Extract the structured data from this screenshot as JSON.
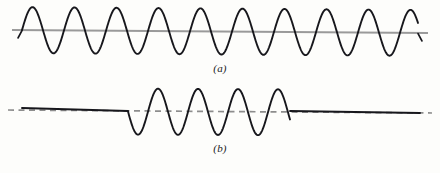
{
  "figure": {
    "title": "",
    "background_color": "#fdfdfb",
    "width": 440,
    "height": 173
  },
  "panels": [
    {
      "id": "a",
      "label": "(a)",
      "description": "continuous sinusoidal wave train",
      "axis": {
        "style": "solid",
        "color": "#9a9a9a",
        "x_start": 12,
        "x_end": 428,
        "y_left": 30,
        "y_right": 33
      },
      "wave": {
        "color": "#17171c",
        "stroke_width": 1.9,
        "x_start": 22,
        "x_end": 418,
        "baseline_y": 31,
        "amplitude": 23,
        "period": 42,
        "cycles": 10,
        "phase_deg": 0
      }
    },
    {
      "id": "b",
      "label": "(b)",
      "description": "wave pulse / finite wave packet with flat segments on both sides",
      "axis": {
        "style": "dashed",
        "color": "#8d8d8d",
        "x_start": 8,
        "x_end": 432,
        "y_left": 30,
        "y_right": 33
      },
      "flat_left": {
        "color": "#17171c",
        "x_start": 22,
        "x_end": 128,
        "y_start": 28,
        "y_end": 31
      },
      "flat_right": {
        "color": "#17171c",
        "x_start": 290,
        "x_end": 420,
        "y_start": 31,
        "y_end": 33
      },
      "wave": {
        "color": "#17171c",
        "stroke_width": 1.9,
        "x_start": 128,
        "x_end": 290,
        "baseline_y": 31,
        "amplitude": 23,
        "period": 40,
        "cycles": 4,
        "phase_deg": 180
      }
    }
  ],
  "chart_data": {
    "type": "line",
    "title": "",
    "xlabel": "",
    "ylabel": "",
    "grid": false,
    "legend": "none",
    "series": [
      {
        "name": "(a) continuous wave train",
        "waveform": "sinusoid",
        "amplitude": 1.0,
        "cycles": 10,
        "extent": "full-width",
        "baseline": 0
      },
      {
        "name": "(b) wave pulse",
        "waveform": "sinusoid burst between two flat segments",
        "amplitude": 1.0,
        "cycles": 4,
        "extent": "center-only",
        "baseline": 0
      }
    ]
  }
}
